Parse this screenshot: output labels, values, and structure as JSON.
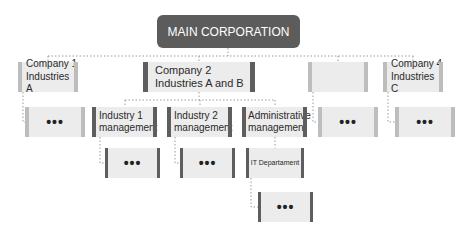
{
  "diagram": {
    "type": "org-chart",
    "root": {
      "label": "MAIN CORPORATION"
    },
    "companies": [
      {
        "label": "Company 1\nIndustries A",
        "line1": "Company 1",
        "line2": "Industries A"
      },
      {
        "label": "Company 2\nIndustries A and B",
        "line1": "Company 2",
        "line2": "Industries A and B"
      },
      {
        "label": "",
        "line1": "",
        "line2": ""
      },
      {
        "label": "Company 4\nIndustries C",
        "line1": "Company 4",
        "line2": "Industries C"
      }
    ],
    "level2": [
      {
        "label": "•••"
      },
      {
        "line1": "Industry 1",
        "line2": "management"
      },
      {
        "line1": "Industry 2",
        "line2": "management"
      },
      {
        "line1": "Administrative",
        "line2": "management"
      },
      {
        "label": "•••"
      },
      {
        "label": "•••"
      }
    ],
    "level3": [
      {
        "label": "•••"
      },
      {
        "label": "•••"
      },
      {
        "label": "IT Departament"
      }
    ],
    "level4": [
      {
        "label": "•••"
      }
    ],
    "colors": {
      "root": "#5c5c5c",
      "box": "#ececec",
      "dark_bar": "#5e5e5e",
      "light_bar": "#bdbdbd",
      "connector": "#9a9a9a"
    }
  }
}
